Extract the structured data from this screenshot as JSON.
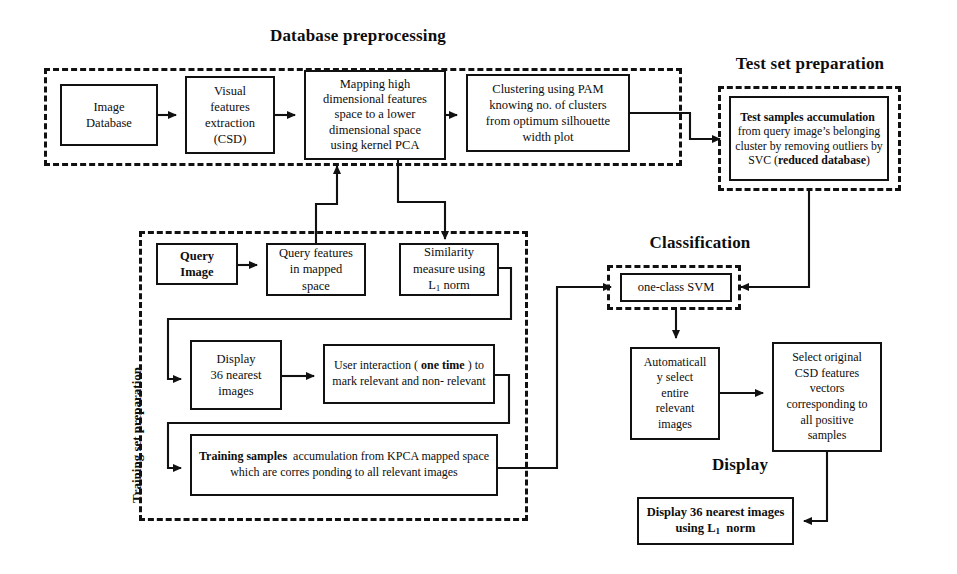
{
  "diagram": {
    "title_note": "CBIR system block diagram",
    "sections": [
      {
        "id": "database-preprocessing",
        "label": "Database preprocessing"
      },
      {
        "id": "test-set-preparation",
        "label": "Test set preparation"
      },
      {
        "id": "training-set-preparation",
        "label": "Training set preparation"
      },
      {
        "id": "classification",
        "label": "Classification"
      },
      {
        "id": "display",
        "label": "Display"
      }
    ],
    "nodes": {
      "image_database": "Image\nDatabase",
      "visual_features": "Visual\nfeatures\nextraction\n(CSD)",
      "kernel_pca": "Mapping high\ndimensional features\nspace to a lower\ndimensional space\nusing kernel PCA",
      "pam_clustering": "Clustering using PAM\nknowing no. of clusters\nfrom optimum silhouette\nwidth plot",
      "test_samples_prefix_bold": "Test samples accumulation",
      "test_samples_rest": " from query image’s belonging cluster by removing outliers by SVC (",
      "test_samples_bold_tail": "reduced database",
      "test_samples_close": ")",
      "query_image": "Query\nImage",
      "query_features": "Query features\nin mapped\nspace",
      "similarity_measure_l1": "Similarity\nmeasure using\nL",
      "similarity_measure_sub": "1",
      "similarity_measure_tail": " norm",
      "display36": "Display\n36 nearest\nimages",
      "user_interaction_a": "User interaction ( ",
      "user_interaction_bold": "one time",
      "user_interaction_b": " ) to mark relevant and non- relevant",
      "training_samples_bold": "Training samples",
      "training_samples_rest": " accumulation from KPCA mapped space which are corres ponding to all relevant images",
      "one_class_svm": "one-class SVM",
      "auto_select": "Automaticall\ny select\nentire\nrelevant\nimages",
      "select_csd": "Select original\nCSD features\nvectors\ncorresponding to\nall positive\nsamples",
      "display_result_a": "Display 36 nearest images using L",
      "display_result_sub": "1",
      "display_result_b": " norm"
    },
    "colors": {
      "stroke": "#111111",
      "background": "#ffffff",
      "text": "#0d0d0d"
    }
  }
}
